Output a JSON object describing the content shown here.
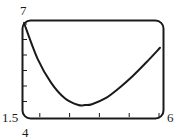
{
  "chart_data": {
    "type": "line",
    "title": "",
    "xlabel": "",
    "ylabel": "",
    "xlim": [
      4,
      6
    ],
    "ylim": [
      1.5,
      7
    ],
    "grid": false,
    "legend": null,
    "window_labels": {
      "xmin": "4",
      "xmax": "6",
      "ymin": "1.5",
      "ymax": "7"
    },
    "x_tick_count": 5,
    "y_tick_count": 6,
    "series": [
      {
        "name": "curve",
        "x": [
          4.0,
          4.2,
          4.4,
          4.6,
          4.8,
          4.9,
          5.0,
          5.2,
          5.4,
          5.6,
          5.8,
          6.0
        ],
        "y": [
          7.0,
          4.9,
          3.5,
          2.6,
          2.2,
          2.2,
          2.25,
          2.6,
          3.2,
          3.9,
          4.7,
          5.55
        ]
      }
    ]
  },
  "colors": {
    "curve": "#1a1a1a",
    "frame": "#1a1a1a",
    "background": "#ffffff"
  }
}
